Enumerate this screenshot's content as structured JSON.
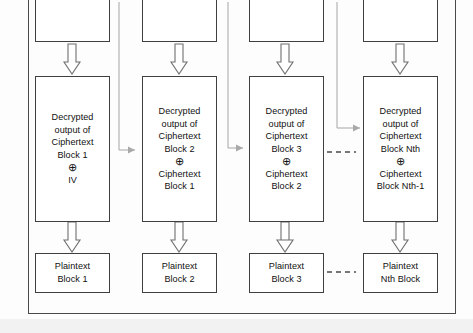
{
  "diagram": {
    "colors": {
      "node_border": "#3f3f3f",
      "frame_border": "#4a4a4a",
      "connector_gray": "#a9a9a9",
      "arrow_outline": "#6b6b6b",
      "background": "#fdfdfd",
      "text": "#101010"
    },
    "symbols": {
      "xor": "⊕",
      "down_arrow": "down-arrow-outline",
      "ellipsis": "- - - - -"
    },
    "columns": [
      {
        "index": 1,
        "top_box": {
          "label": ""
        },
        "cipher_box": {
          "lines": [
            "Decrypted",
            "output of",
            "Ciphertext",
            "Block 1",
            "⊕",
            "IV"
          ]
        },
        "plain_box": {
          "lines": [
            "Plaintext",
            "Block 1"
          ]
        }
      },
      {
        "index": 2,
        "top_box": {
          "label": ""
        },
        "cipher_box": {
          "lines": [
            "Decrypted",
            "output of",
            "Ciphertext",
            "Block 2",
            "⊕",
            "Ciphertext",
            "Block 1"
          ]
        },
        "plain_box": {
          "lines": [
            "Plaintext",
            "Block 2"
          ]
        }
      },
      {
        "index": 3,
        "top_box": {
          "label": ""
        },
        "cipher_box": {
          "lines": [
            "Decrypted",
            "output of",
            "Ciphertext",
            "Block 3",
            "⊕",
            "Ciphertext",
            "Block 2"
          ]
        },
        "plain_box": {
          "lines": [
            "Plaintext",
            "Block 3"
          ]
        }
      },
      {
        "index": 4,
        "top_box": {
          "label": ""
        },
        "cipher_box": {
          "lines": [
            "Decrypted",
            "output of",
            "Ciphertext",
            "Block Nth",
            "⊕",
            "Ciphertext",
            "Block Nth-1"
          ]
        },
        "plain_box": {
          "lines": [
            "Plaintext",
            "Nth Block"
          ]
        }
      }
    ],
    "ellipsis_markers": [
      {
        "name": "ellipsis-cipher-row",
        "text": "- - - -"
      },
      {
        "name": "ellipsis-plaintext-row",
        "text": "- - - -"
      }
    ]
  }
}
